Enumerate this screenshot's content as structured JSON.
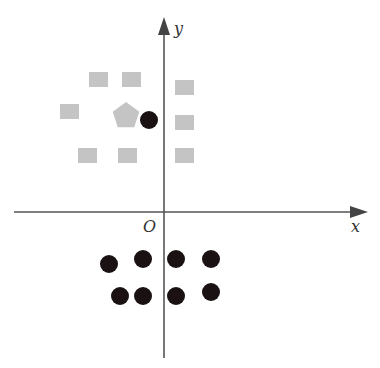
{
  "diagram": {
    "type": "coordinate-plane-scatter",
    "axes": {
      "x_label": "x",
      "y_label": "y",
      "origin_label": "O",
      "color": "#555555"
    },
    "colors": {
      "gray_shape": "#c4c4c4",
      "black_dot": "#1a1212"
    },
    "gray_squares": [
      {
        "x": 89,
        "y": 72
      },
      {
        "x": 122,
        "y": 72
      },
      {
        "x": 60,
        "y": 104
      },
      {
        "x": 175,
        "y": 80
      },
      {
        "x": 175,
        "y": 115
      },
      {
        "x": 175,
        "y": 148
      },
      {
        "x": 78,
        "y": 148
      },
      {
        "x": 118,
        "y": 148
      }
    ],
    "gray_pentagon": {
      "cx": 126,
      "cy": 116,
      "r": 14
    },
    "black_dots": [
      {
        "cx": 149,
        "cy": 120
      },
      {
        "cx": 109,
        "cy": 264
      },
      {
        "cx": 143,
        "cy": 259
      },
      {
        "cx": 176,
        "cy": 259
      },
      {
        "cx": 211,
        "cy": 259
      },
      {
        "cx": 120,
        "cy": 296
      },
      {
        "cx": 143,
        "cy": 296
      },
      {
        "cx": 176,
        "cy": 296
      },
      {
        "cx": 211,
        "cy": 292
      }
    ]
  }
}
